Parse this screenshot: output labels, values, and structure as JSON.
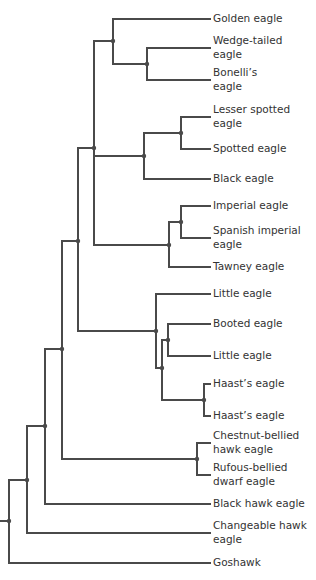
{
  "tree": {
    "line_color": "#4a4a4a",
    "text_color": "#333333",
    "leaves": [
      {
        "label": "Golden eagle",
        "y": 19,
        "lines": 1
      },
      {
        "label": "Wedge-tailed eagle",
        "y": 48,
        "lines": 2,
        "line1": "Wedge-tailed",
        "line2": "eagle"
      },
      {
        "label": "Bonelli's eagle",
        "y": 80,
        "lines": 2,
        "line1": "Bonelli’s",
        "line2": "eagle"
      },
      {
        "label": "Lesser spotted eagle",
        "y": 117,
        "lines": 2,
        "line1": "Lesser spotted",
        "line2": "eagle"
      },
      {
        "label": "Spotted eagle",
        "y": 149,
        "lines": 1
      },
      {
        "label": "Black eagle",
        "y": 179,
        "lines": 1
      },
      {
        "label": "Imperial eagle",
        "y": 206,
        "lines": 1
      },
      {
        "label": "Spanish imperial eagle",
        "y": 238,
        "lines": 2,
        "line1": "Spanish imperial",
        "line2": "eagle"
      },
      {
        "label": "Tawney eagle",
        "y": 267,
        "lines": 1
      },
      {
        "label": "Little eagle",
        "y": 294,
        "lines": 1
      },
      {
        "label": "Booted eagle",
        "y": 324,
        "lines": 1
      },
      {
        "label": "Little eagle",
        "y": 356,
        "lines": 1
      },
      {
        "label": "Haast's eagle",
        "y": 384,
        "lines": 1
      },
      {
        "label": "Haast's eagle",
        "y": 416,
        "lines": 1
      },
      {
        "label": "Chestnut-bellied hawk eagle",
        "y": 443,
        "lines": 2,
        "line1": "Chestnut-bellied",
        "line2": "hawk eagle"
      },
      {
        "label": "Rufous-bellied dwarf eagle",
        "y": 475,
        "lines": 2,
        "line1": "Rufous-bellied",
        "line2": "dwarf eagle"
      },
      {
        "label": "Black hawk eagle",
        "y": 504,
        "lines": 1
      },
      {
        "label": "Changeable hawk eagle",
        "y": 533,
        "lines": 2,
        "line1": "Changeable hawk",
        "line2": "eagle"
      },
      {
        "label": "Goshawk",
        "y": 563,
        "lines": 1
      }
    ],
    "labels": {
      "l0": "Golden eagle",
      "l1a": "Wedge-tailed",
      "l1b": "eagle",
      "l2a": "Bonelli’s",
      "l2b": "eagle",
      "l3a": "Lesser spotted",
      "l3b": "eagle",
      "l4": "Spotted eagle",
      "l5": "Black eagle",
      "l6": "Imperial eagle",
      "l7a": "Spanish imperial",
      "l7b": "eagle",
      "l8": "Tawney eagle",
      "l9": "Little eagle",
      "l10": "Booted eagle",
      "l11": "Little eagle",
      "l12": "Haast’s eagle",
      "l13": "Haast’s eagle",
      "l14a": "Chestnut-bellied",
      "l14b": "hawk eagle",
      "l15a": "Rufous-bellied",
      "l15b": "dwarf eagle",
      "l16": "Black hawk eagle",
      "l17a": "Changeable hawk",
      "l17b": "eagle",
      "l18": "Goshawk"
    }
  }
}
